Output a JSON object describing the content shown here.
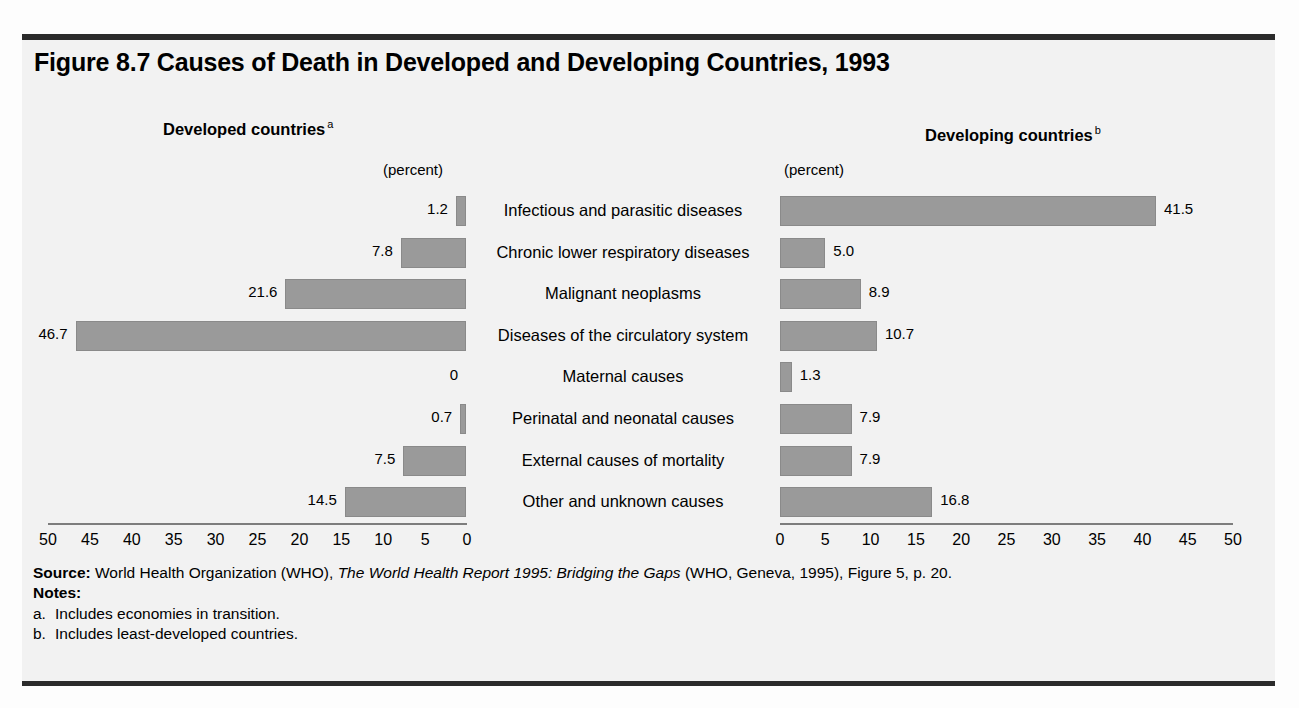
{
  "figure": {
    "title": "Figure 8.7  Causes of Death in Developed and Developing Countries, 1993"
  },
  "panels": {
    "left": {
      "heading": "Developed countries",
      "heading_note": "a",
      "unit_label": "(percent)"
    },
    "right": {
      "heading": "Developing countries",
      "heading_note": "b",
      "unit_label": "(percent)"
    }
  },
  "footer": {
    "source_label": "Source:",
    "source_text_1": " World Health Organization (WHO), ",
    "source_italic": "The World Health Report 1995: Bridging the Gaps",
    "source_text_2": " (WHO, Geneva, 1995), Figure 5, p. 20.",
    "notes_label": "Notes:",
    "notes": [
      {
        "marker": "a.",
        "text": "Includes economies in transition."
      },
      {
        "marker": "b.",
        "text": "Includes least-developed countries."
      }
    ]
  },
  "chart_data": {
    "type": "bar",
    "orientation": "horizontal",
    "layout": "diverging-pyramid",
    "title": "Figure 8.7  Causes of Death in Developed and Developing Countries, 1993",
    "xlabel": "(percent)",
    "ylabel": "",
    "xlim": [
      0,
      50
    ],
    "grid": false,
    "legend_position": "top",
    "bar_color": "#9a9a9a",
    "categories": [
      "Infectious and parasitic diseases",
      "Chronic lower respiratory diseases",
      "Malignant neoplasms",
      "Diseases of the circulatory system",
      "Maternal causes",
      "Perinatal and neonatal causes",
      "External causes of mortality",
      "Other and unknown causes"
    ],
    "series": [
      {
        "name": "Developed countries",
        "note": "a",
        "direction": "left",
        "values": [
          1.2,
          7.8,
          21.6,
          46.7,
          0,
          0.7,
          7.5,
          14.5
        ],
        "labels": [
          "1.2",
          "7.8",
          "21.6",
          "46.7",
          "0",
          "0.7",
          "7.5",
          "14.5"
        ]
      },
      {
        "name": "Developing countries",
        "note": "b",
        "direction": "right",
        "values": [
          41.5,
          5.0,
          8.9,
          10.7,
          1.3,
          7.9,
          7.9,
          16.8
        ],
        "labels": [
          "41.5",
          "5.0",
          "8.9",
          "10.7",
          "1.3",
          "7.9",
          "7.9",
          "16.8"
        ]
      }
    ],
    "left_ticks": [
      "50",
      "45",
      "40",
      "35",
      "30",
      "25",
      "20",
      "15",
      "10",
      "5",
      "0"
    ],
    "right_ticks": [
      "0",
      "5",
      "10",
      "15",
      "20",
      "25",
      "30",
      "35",
      "40",
      "45",
      "50"
    ]
  }
}
